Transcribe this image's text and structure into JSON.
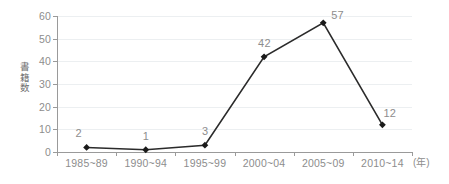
{
  "chart_data": {
    "type": "line",
    "title": "",
    "subtitle": "",
    "xlabel": "",
    "ylabel": "書籍数",
    "x_unit": "(年)",
    "categories": [
      "1985~89",
      "1990~94",
      "1995~99",
      "2000~04",
      "2005~09",
      "2010~14"
    ],
    "values": [
      2,
      1,
      3,
      42,
      57,
      12
    ],
    "data_labels": [
      "2",
      "1",
      "3",
      "42",
      "57",
      "12"
    ],
    "ylim": [
      0,
      60
    ],
    "yticks": [
      "0",
      "10",
      "20",
      "30",
      "40",
      "50",
      "60"
    ],
    "ytick_values": [
      0,
      10,
      20,
      30,
      40,
      50,
      60
    ],
    "grid": "horizontal",
    "legend": "none",
    "marker": "diamond",
    "colors": {
      "line": "#2b2b2b",
      "marker": "#1a1a1a",
      "gridline": "#eceff1",
      "axis": "#9a9a9a",
      "tick_label": "#8d8d8d",
      "axis_title": "#6e6e6e",
      "background": "#ffffff"
    }
  }
}
